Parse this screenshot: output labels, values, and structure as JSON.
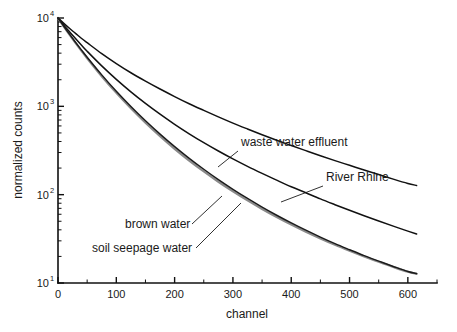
{
  "chart_data": {
    "type": "line",
    "title": "",
    "xlabel": "channel",
    "ylabel": "normalized counts",
    "yscale": "log",
    "xscale": "linear",
    "xlim": [
      0,
      650
    ],
    "ylim": [
      10,
      10000
    ],
    "grid": false,
    "legend_position": "inline-annotations",
    "xticks": [
      0,
      100,
      200,
      300,
      400,
      500,
      600
    ],
    "xtick_labels": [
      "0",
      "100",
      "200",
      "300",
      "400",
      "500",
      "600"
    ],
    "x_minor_ticks": [
      50,
      150,
      250,
      350,
      450,
      550,
      650
    ],
    "yticks": [
      10,
      100,
      1000,
      10000
    ],
    "ytick_labels": [
      "10¹",
      "10²",
      "10³",
      "10⁴"
    ],
    "ytick_mantissa": [
      "10",
      "10",
      "10",
      "10"
    ],
    "ytick_exponent": [
      "1",
      "2",
      "3",
      "4"
    ],
    "x": [
      0,
      10,
      20,
      30,
      40,
      50,
      75,
      100,
      125,
      150,
      175,
      200,
      225,
      250,
      275,
      300,
      325,
      350,
      375,
      400,
      425,
      450,
      475,
      500,
      525,
      550,
      575,
      600,
      615
    ],
    "series": [
      {
        "name": "waste water effluent",
        "color": "#111111",
        "linewidth": 1.5,
        "values": [
          10000,
          8700,
          7600,
          6700,
          5900,
          5250,
          3950,
          3050,
          2400,
          1930,
          1570,
          1290,
          1070,
          900,
          760,
          646,
          554,
          477,
          413,
          360,
          315,
          276,
          243,
          215,
          190,
          169,
          150,
          134,
          127
        ]
      },
      {
        "name": "River Rhine",
        "color": "#111111",
        "linewidth": 1.5,
        "values": [
          10000,
          8300,
          6950,
          5850,
          4950,
          4200,
          2870,
          2020,
          1460,
          1080,
          815,
          626,
          489,
          388,
          312,
          254,
          209,
          174,
          146,
          123,
          105,
          89.5,
          77.0,
          66.5,
          57.7,
          50.3,
          44.0,
          38.7,
          35.9
        ]
      },
      {
        "name": "brown water",
        "color": "#1b1b1b",
        "linewidth": 1.5,
        "values": [
          10000,
          8050,
          6520,
          5320,
          4360,
          3590,
          2270,
          1480,
          995,
          686,
          485,
          350,
          258,
          194,
          148,
          115,
          90.6,
          72.3,
          58.5,
          47.9,
          39.6,
          33.1,
          27.9,
          23.8,
          20.4,
          17.7,
          15.4,
          13.5,
          12.8
        ]
      },
      {
        "name": "soil seepage water",
        "color": "#8a8a8a",
        "linewidth": 2.2,
        "values": [
          10000,
          8000,
          6450,
          5230,
          4270,
          3500,
          2190,
          1420,
          950,
          652,
          459,
          330,
          243,
          183,
          140,
          109,
          86.1,
          68.9,
          55.9,
          45.9,
          38.1,
          32.0,
          27.1,
          23.2,
          20.0,
          17.4,
          15.2,
          13.4,
          12.7
        ]
      }
    ],
    "annotations": [
      {
        "label": "waste water effluent",
        "text_x": 241,
        "text_y": 146,
        "leader_from": [
          238,
          151
        ],
        "leader_to": [
          218,
          167
        ]
      },
      {
        "label": "River Rhine",
        "text_x": 326,
        "text_y": 181,
        "leader_from": [
          323,
          186
        ],
        "leader_to": [
          281,
          202
        ]
      },
      {
        "label": "brown water",
        "text_x": 125,
        "text_y": 228,
        "leader_from": [
          192,
          224
        ],
        "leader_to": [
          222,
          196
        ]
      },
      {
        "label": "soil seepage water",
        "text_x": 92,
        "text_y": 252,
        "leader_from": [
          196,
          248
        ],
        "leader_to": [
          241,
          203
        ]
      }
    ]
  },
  "figure": {
    "background_color": "#ffffff",
    "axis_color": "#101010",
    "text_color": "#1a1a1a"
  }
}
